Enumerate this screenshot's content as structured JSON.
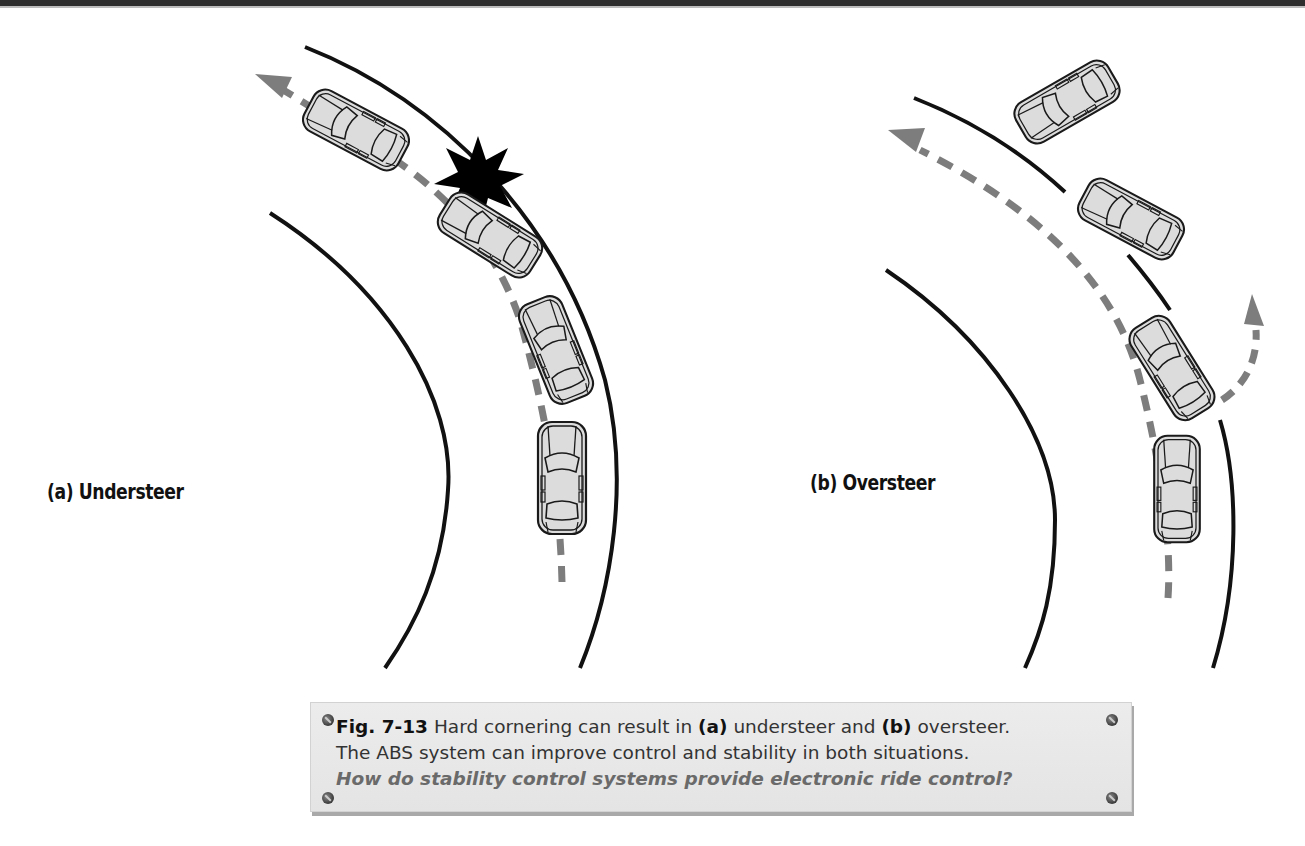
{
  "header_strip": {
    "color": "#2e2e2e"
  },
  "panels": [
    {
      "id": "a",
      "label": "(a) Understeer",
      "description": "Car drifts outward and strikes outside road edge",
      "cars": 4,
      "collision_marker": "starburst"
    },
    {
      "id": "b",
      "label": "(b) Oversteer",
      "description": "Rear swings out; car spins off outside of curve",
      "cars": 4
    }
  ],
  "caption": {
    "figure_number": "Fig. 7-13",
    "text_1": " Hard cornering can result in ",
    "a": "(a)",
    "text_2": " understeer and ",
    "b": "(b)",
    "text_3": " oversteer.",
    "line_2": "The ABS system can improve control and stability in both situations.",
    "question": "How do stability control systems provide electronic ride control?"
  },
  "colors": {
    "road_line": "#111111",
    "path_dash": "#7d7d7d",
    "car_fill": "#dcdcdc",
    "car_outline": "#1a1a1a",
    "caption_bg": "#e6e6e6",
    "question_text": "#6a6a6a"
  }
}
